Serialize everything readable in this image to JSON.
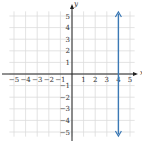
{
  "chart_data": {
    "type": "line",
    "title": "",
    "xlabel": "x",
    "ylabel": "y",
    "xlim": [
      -6,
      6
    ],
    "ylim": [
      -6,
      6
    ],
    "grid": true,
    "x_ticks": [
      "−5",
      "−4",
      "−3",
      "−2",
      "−1",
      "1",
      "2",
      "3",
      "4",
      "5"
    ],
    "y_ticks": [
      "5",
      "4",
      "3",
      "2",
      "1",
      "−1",
      "−2",
      "−3",
      "−4",
      "−5"
    ],
    "series": [
      {
        "name": "x = 4",
        "x": [
          4,
          4
        ],
        "y": [
          -5,
          5
        ],
        "color": "#3a78b5",
        "arrows": "both"
      }
    ]
  },
  "colors": {
    "grid": "#dcdcdc",
    "axis": "#222222",
    "line": "#3a78b5"
  }
}
